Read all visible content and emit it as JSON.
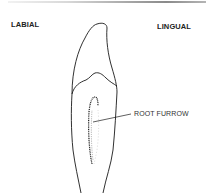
{
  "figure": {
    "labels": {
      "labial": "LABIAL",
      "lingual": "LINGUAL",
      "root_furrow": "ROOT FURROW"
    },
    "colors": {
      "outline": "#1a1a1a",
      "text": "#222222",
      "background": "#ffffff"
    }
  }
}
